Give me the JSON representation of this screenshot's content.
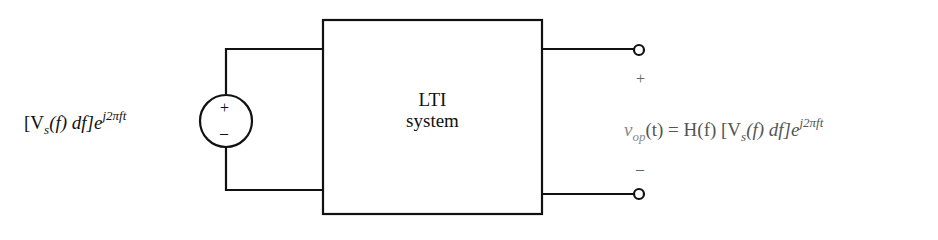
{
  "diagram": {
    "block": {
      "line1": "LTI",
      "line2": "system"
    },
    "source": {
      "plus": "+",
      "minus": "–"
    },
    "input_expr": {
      "open": "[V",
      "sub": "s",
      "mid": "(f) df]e",
      "exp": "j2πft"
    },
    "output": {
      "plus": "+",
      "minus": "–",
      "expr": {
        "v": "v",
        "sub": "op",
        "mid": "(t) = H(f) [V",
        "sub2": "s",
        "mid2": "(f) df]e",
        "exp": "j2πft"
      }
    }
  }
}
